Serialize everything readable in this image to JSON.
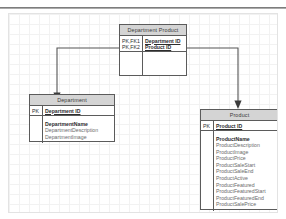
{
  "diagram": {
    "colors": {
      "header_fill": "#d4d4d4",
      "border": "#5b5b5b",
      "grid": "#f2f2f2",
      "connector": "#555555"
    },
    "entities": [
      {
        "id": "department-product",
        "name": "Department Product",
        "keys": [
          {
            "key": "PK,FK1",
            "attribute": "Department ID"
          },
          {
            "key": "PK,FK2",
            "attribute": "Product ID"
          }
        ],
        "attributes": []
      },
      {
        "id": "department",
        "name": "Department",
        "keys": [
          {
            "key": "PK",
            "attribute": "Department ID"
          }
        ],
        "attributes": [
          {
            "name": "DepartmentName",
            "bold": true
          },
          {
            "name": "DepartmentDescription",
            "bold": false
          },
          {
            "name": "DepartmentImage",
            "bold": false
          }
        ]
      },
      {
        "id": "product",
        "name": "Product",
        "keys": [
          {
            "key": "PK",
            "attribute": "Product ID"
          }
        ],
        "attributes": [
          {
            "name": "ProductName",
            "bold": true
          },
          {
            "name": "ProductDescription",
            "bold": false
          },
          {
            "name": "ProductImage",
            "bold": false
          },
          {
            "name": "ProductPrice",
            "bold": false
          },
          {
            "name": "ProductSaleStart",
            "bold": false
          },
          {
            "name": "ProductSaleEnd",
            "bold": false
          },
          {
            "name": "ProductActive",
            "bold": false
          },
          {
            "name": "ProductFeatured",
            "bold": false
          },
          {
            "name": "ProductFeaturedStart",
            "bold": false
          },
          {
            "name": "ProductFeaturedEnd",
            "bold": false
          },
          {
            "name": "ProductSalePrice",
            "bold": false
          }
        ]
      }
    ],
    "relationships": [
      {
        "id": "dp-to-department",
        "from": "department-product",
        "to": "department"
      },
      {
        "id": "dp-to-product",
        "from": "department-product",
        "to": "product"
      }
    ]
  }
}
